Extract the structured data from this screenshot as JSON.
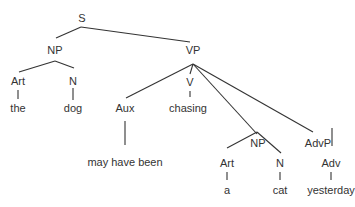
{
  "diagram": {
    "type": "syntax-tree",
    "colors": {
      "line": "#333333",
      "text": "#333333",
      "background": "#ffffff"
    },
    "nodes": [
      {
        "id": "S",
        "label": "S",
        "x": 82,
        "y": 18
      },
      {
        "id": "NP1",
        "label": "NP",
        "x": 55,
        "y": 50
      },
      {
        "id": "VP",
        "label": "VP",
        "x": 193,
        "y": 50
      },
      {
        "id": "Art1",
        "label": "Art",
        "x": 18,
        "y": 81
      },
      {
        "id": "N1",
        "label": "N",
        "x": 73,
        "y": 81
      },
      {
        "id": "the",
        "label": "the",
        "x": 18,
        "y": 108
      },
      {
        "id": "dog",
        "label": "dog",
        "x": 73,
        "y": 108
      },
      {
        "id": "Aux",
        "label": "Aux",
        "x": 125,
        "y": 108
      },
      {
        "id": "V",
        "label": "V",
        "x": 190,
        "y": 82
      },
      {
        "id": "chasing",
        "label": "chasing",
        "x": 188,
        "y": 108
      },
      {
        "id": "mayhavebeen",
        "label": "may have been",
        "x": 125,
        "y": 162
      },
      {
        "id": "NP2",
        "label": "NP",
        "x": 258,
        "y": 143
      },
      {
        "id": "AdvP",
        "label": "AdvP",
        "x": 318,
        "y": 143
      },
      {
        "id": "Art2",
        "label": "Art",
        "x": 227,
        "y": 163
      },
      {
        "id": "N2",
        "label": "N",
        "x": 280,
        "y": 163
      },
      {
        "id": "Adv",
        "label": "Adv",
        "x": 331,
        "y": 163
      },
      {
        "id": "a",
        "label": "a",
        "x": 227,
        "y": 190
      },
      {
        "id": "cat",
        "label": "cat",
        "x": 280,
        "y": 190
      },
      {
        "id": "yesterday",
        "label": "yesterday",
        "x": 331,
        "y": 190
      }
    ],
    "edges": [
      {
        "from": "S",
        "to": "NP1",
        "x1": 81,
        "y1": 27,
        "x2": 56,
        "y2": 38
      },
      {
        "from": "S",
        "to": "VP",
        "x1": 81,
        "y1": 27,
        "x2": 190,
        "y2": 42
      },
      {
        "from": "NP1",
        "to": "Art1",
        "x1": 55,
        "y1": 61,
        "x2": 19,
        "y2": 72
      },
      {
        "from": "NP1",
        "to": "N1",
        "x1": 55,
        "y1": 61,
        "x2": 74,
        "y2": 68
      },
      {
        "from": "Art1",
        "to": "the",
        "x1": 18,
        "y1": 90,
        "x2": 18,
        "y2": 99
      },
      {
        "from": "N1",
        "to": "dog",
        "x1": 73,
        "y1": 88,
        "x2": 73,
        "y2": 100
      },
      {
        "from": "VP",
        "to": "Aux",
        "x1": 193,
        "y1": 64,
        "x2": 126,
        "y2": 98
      },
      {
        "from": "VP",
        "to": "V",
        "x1": 193,
        "y1": 64,
        "x2": 190,
        "y2": 74
      },
      {
        "from": "V",
        "to": "chasing",
        "x1": 190,
        "y1": 91,
        "x2": 190,
        "y2": 97
      },
      {
        "from": "VP",
        "to": "NP2",
        "x1": 193,
        "y1": 64,
        "x2": 257,
        "y2": 134
      },
      {
        "from": "VP",
        "to": "AdvP",
        "x1": 193,
        "y1": 64,
        "x2": 313,
        "y2": 132
      },
      {
        "from": "Aux",
        "to": "mayhavebeen",
        "x1": 125,
        "y1": 121,
        "x2": 125,
        "y2": 145
      },
      {
        "from": "NP2",
        "to": "Art2",
        "x1": 257,
        "y1": 132,
        "x2": 227,
        "y2": 148
      },
      {
        "from": "NP2",
        "to": "N2",
        "x1": 257,
        "y1": 132,
        "x2": 281,
        "y2": 153
      },
      {
        "from": "AdvP",
        "to": "Adv",
        "x1": 332,
        "y1": 128,
        "x2": 332,
        "y2": 146
      },
      {
        "from": "Art2",
        "to": "a",
        "x1": 227,
        "y1": 172,
        "x2": 227,
        "y2": 180
      },
      {
        "from": "N2",
        "to": "cat",
        "x1": 280,
        "y1": 172,
        "x2": 280,
        "y2": 180
      },
      {
        "from": "Adv",
        "to": "yesterday",
        "x1": 331,
        "y1": 172,
        "x2": 331,
        "y2": 180
      }
    ]
  }
}
